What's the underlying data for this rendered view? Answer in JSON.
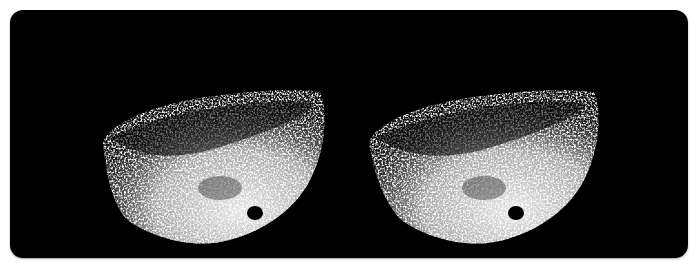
{
  "image": {
    "description": "Stereo pair of asteroid photographs on black background",
    "background_color": "#000000",
    "page_color": "#ffffff",
    "frames": [
      {
        "id": "left",
        "subject": "asteroid",
        "offset_x": 0
      },
      {
        "id": "right",
        "subject": "asteroid",
        "offset_x": 339
      }
    ]
  }
}
